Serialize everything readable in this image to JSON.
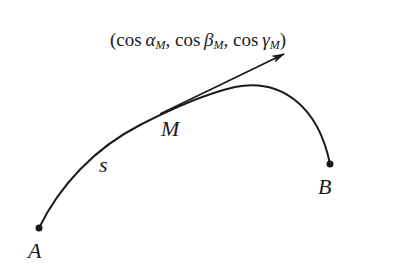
{
  "figure": {
    "direction_label": {
      "open": "(",
      "terms": [
        {
          "func": "cos",
          "angle": "α",
          "sub": "M"
        },
        {
          "func": "cos",
          "angle": "β",
          "sub": "M"
        },
        {
          "func": "cos",
          "angle": "γ",
          "sub": "M"
        }
      ],
      "sep": ", ",
      "close": ")"
    },
    "points": {
      "A": {
        "label": "A",
        "x": 39,
        "y": 228
      },
      "B": {
        "label": "B",
        "x": 330,
        "y": 164
      }
    },
    "curve_point_label": "M",
    "arc_length_label": "s",
    "colors": {
      "ink": "#1a1a1a",
      "background": "#ffffff"
    }
  }
}
